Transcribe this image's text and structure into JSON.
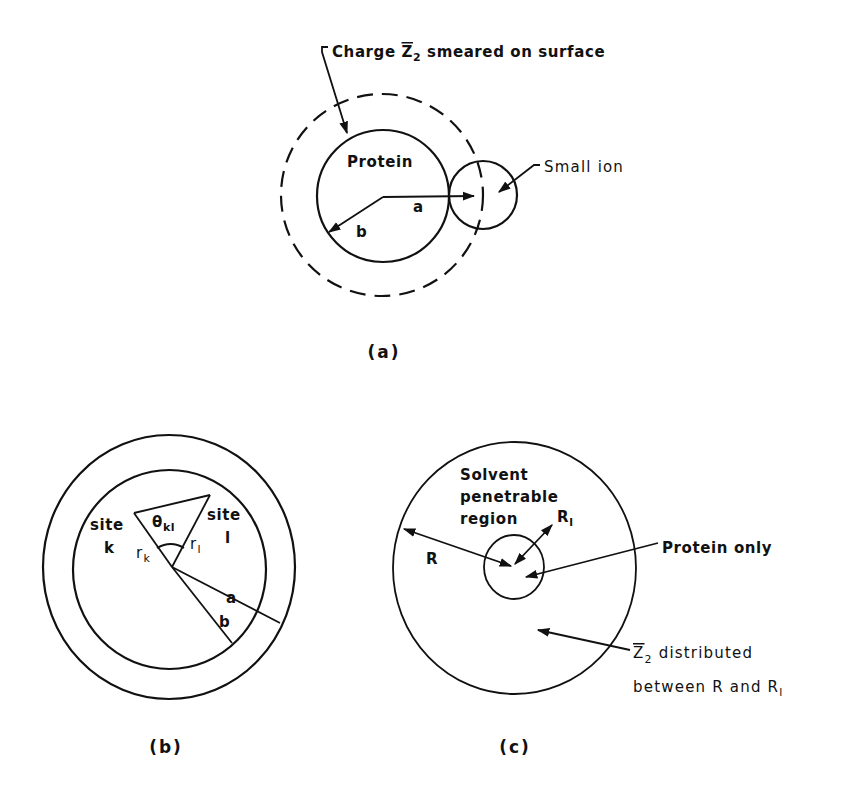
{
  "figure": {
    "panels": [
      {
        "id": "a",
        "caption": "(a)",
        "labels": {
          "charge_prefix": "Charge ",
          "charge_symbol": "Z",
          "charge_subscript": "2",
          "charge_suffix": " smeared on surface",
          "protein": "Protein",
          "small_ion": "Small ion",
          "radius_a": "a",
          "radius_b": "b"
        }
      },
      {
        "id": "b",
        "caption": "(b)",
        "labels": {
          "site_k_line1": "site",
          "site_k_line2": "k",
          "site_l_line1": "site",
          "site_l_line2": "l",
          "theta": "θ",
          "theta_subscript": "kl",
          "r_k": "r",
          "r_k_subscript": "k",
          "r_l": "r",
          "r_l_subscript": "l",
          "radius_a": "a",
          "radius_b": "b"
        }
      },
      {
        "id": "c",
        "caption": "(c)",
        "labels": {
          "solvent_line1": "Solvent",
          "solvent_line2": "penetrable",
          "solvent_line3": "region",
          "radius_R": "R",
          "radius_R1": "R",
          "radius_R1_subscript": "l",
          "protein_only": "Protein only",
          "z2_symbol": "Z",
          "z2_subscript": "2",
          "z2_line1_suffix": " distributed",
          "z2_line2": "between R and R",
          "z2_line2_subscript": "l"
        }
      }
    ]
  }
}
